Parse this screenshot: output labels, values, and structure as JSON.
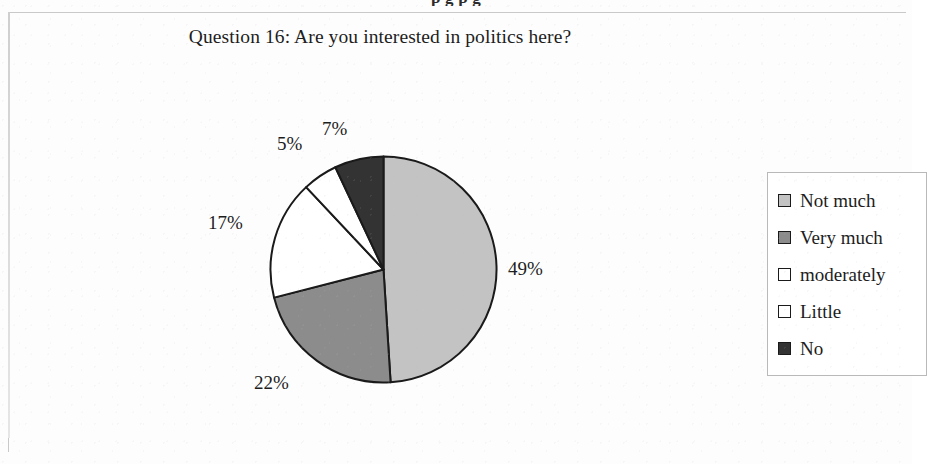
{
  "page": {
    "bleed_text_above": "p          g  p                                      g"
  },
  "chart": {
    "title": "Question 16: Are you interested in politics here?"
  },
  "legend": {
    "items": [
      {
        "label": "Not much",
        "color": "#c3c3c3"
      },
      {
        "label": "Very much",
        "color": "#8c8c8c"
      },
      {
        "label": "moderately",
        "color": "#ffffff"
      },
      {
        "label": "Little",
        "color": "#ffffff"
      },
      {
        "label": "No",
        "color": "#333333"
      }
    ]
  },
  "chart_data": {
    "type": "pie",
    "title": "Question 16: Are you interested in politics here?",
    "xlabel": "",
    "ylabel": "",
    "unit": "percent",
    "start_angle_deg": 0,
    "direction": "clockwise",
    "legend_position": "right",
    "grid": false,
    "categories": [
      "Not much",
      "Very much",
      "moderately",
      "Little",
      "No"
    ],
    "values": [
      49,
      22,
      17,
      5,
      7
    ],
    "data_labels": [
      "49%",
      "22%",
      "17%",
      "5%",
      "7%"
    ],
    "colors": [
      "#c3c3c3",
      "#8c8c8c",
      "#ffffff",
      "#ffffff",
      "#333333"
    ],
    "slice_border_color": "#1a1a1a"
  }
}
